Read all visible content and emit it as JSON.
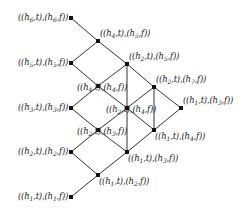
{
  "diagram": {
    "type": "lattice",
    "nodes": [
      {
        "id": "L1",
        "x": 71,
        "y": 18,
        "h_t": "6",
        "h_f": "6",
        "label_side": "left"
      },
      {
        "id": "L2",
        "x": 71,
        "y": 63,
        "h_t": "5",
        "h_f": "5",
        "label_side": "left"
      },
      {
        "id": "L3",
        "x": 71,
        "y": 108,
        "h_t": "3",
        "h_f": "3",
        "label_side": "left"
      },
      {
        "id": "L4",
        "x": 71,
        "y": 152,
        "h_t": "2",
        "h_f": "2",
        "label_side": "left"
      },
      {
        "id": "L5",
        "x": 71,
        "y": 197,
        "h_t": "1",
        "h_f": "1",
        "label_side": "left"
      },
      {
        "id": "A",
        "x": 98,
        "y": 41,
        "h_t": "4",
        "h_f": "5",
        "label_side": "above-right"
      },
      {
        "id": "E",
        "x": 127,
        "y": 64,
        "h_t": "2",
        "h_f": "5",
        "label_side": "above-right"
      },
      {
        "id": "H",
        "x": 154,
        "y": 87,
        "h_t": "2",
        "h_f": "7",
        "label_side": "above-right"
      },
      {
        "id": "J",
        "x": 181,
        "y": 108,
        "h_t": "1",
        "h_f": "3",
        "label_side": "above-right"
      },
      {
        "id": "B",
        "x": 98,
        "y": 86,
        "h_t": "4",
        "h_f": "4",
        "label_side": "below-center"
      },
      {
        "id": "F",
        "x": 127,
        "y": 108,
        "h_t": "2",
        "h_f": "4",
        "label_side": "below-center"
      },
      {
        "id": "I",
        "x": 154,
        "y": 130,
        "h_t": "1",
        "h_f": "4",
        "label_side": "below-right"
      },
      {
        "id": "C",
        "x": 98,
        "y": 130,
        "h_t": "2",
        "h_f": "3",
        "label_side": "below-center"
      },
      {
        "id": "G",
        "x": 127,
        "y": 152,
        "h_t": "1",
        "h_f": "3",
        "label_side": "below-right"
      },
      {
        "id": "D",
        "x": 98,
        "y": 175,
        "h_t": "1",
        "h_f": "2",
        "label_side": "below-right"
      }
    ],
    "edges": [
      [
        "L1",
        "A"
      ],
      [
        "L2",
        "A"
      ],
      [
        "A",
        "E"
      ],
      [
        "E",
        "H"
      ],
      [
        "H",
        "J"
      ],
      [
        "L2",
        "B"
      ],
      [
        "L3",
        "B"
      ],
      [
        "B",
        "E"
      ],
      [
        "B",
        "F"
      ],
      [
        "E",
        "F"
      ],
      [
        "F",
        "H"
      ],
      [
        "H",
        "I"
      ],
      [
        "J",
        "I"
      ],
      [
        "F",
        "I"
      ],
      [
        "L3",
        "C"
      ],
      [
        "L4",
        "C"
      ],
      [
        "C",
        "F"
      ],
      [
        "C",
        "G"
      ],
      [
        "F",
        "G"
      ],
      [
        "G",
        "I"
      ],
      [
        "L4",
        "D"
      ],
      [
        "L5",
        "D"
      ],
      [
        "D",
        "G"
      ]
    ],
    "label_template": "((h{t},t),(h{f},f))",
    "colors": {
      "line": "#333333",
      "node": "#111111",
      "text": "#222222",
      "background": "#ffffff"
    }
  }
}
